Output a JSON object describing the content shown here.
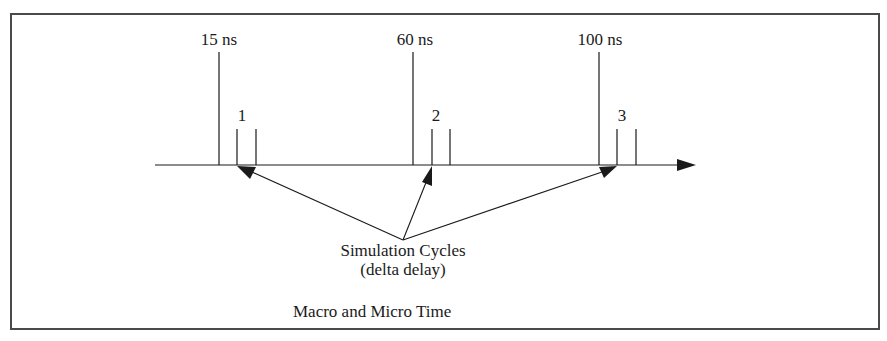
{
  "figure": {
    "title": "Macro and Micro Time",
    "annotation": {
      "line1": "Simulation Cycles",
      "line2": "(delta delay)"
    },
    "time_markers": [
      {
        "label": "15 ns",
        "x": 219
      },
      {
        "label": "60 ns",
        "x": 413
      },
      {
        "label": "100 ns",
        "x": 599
      }
    ],
    "cycle_markers": [
      {
        "label": "1",
        "x": 237,
        "next_x": 256
      },
      {
        "label": "2",
        "x": 432,
        "next_x": 450
      },
      {
        "label": "3",
        "x": 617,
        "next_x": 636
      }
    ],
    "colors": {
      "line": "#1a1a1a",
      "frame": "#4a4a4a",
      "background": "#ffffff"
    }
  }
}
